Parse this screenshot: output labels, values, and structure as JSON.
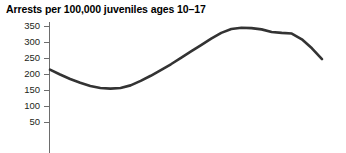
{
  "chart_data": {
    "type": "line",
    "title": "Arrests per 100,000 juveniles ages 10–17",
    "xlabel": "",
    "ylabel": "",
    "ylim": [
      0,
      350
    ],
    "yticks": [
      50,
      100,
      150,
      200,
      250,
      300,
      350
    ],
    "ytick_labels": [
      "50",
      "100",
      "150",
      "200",
      "250",
      "300",
      "350"
    ],
    "grid": false,
    "legend": "none",
    "line_color": "#333333",
    "axis_color": "#666666",
    "x_axis_cropped": true,
    "series": [
      {
        "name": "Arrests per 100,000 juveniles ages 10-17",
        "x": [
          0,
          1,
          2,
          3,
          4,
          5,
          6,
          7,
          8,
          9,
          10,
          11,
          12,
          13,
          14,
          15,
          16,
          17,
          18,
          19,
          20,
          21,
          22,
          23,
          24,
          25,
          26,
          27
        ],
        "values": [
          215,
          200,
          186,
          174,
          164,
          158,
          156,
          158,
          166,
          180,
          196,
          214,
          232,
          252,
          272,
          292,
          312,
          330,
          342,
          346,
          345,
          341,
          333,
          330,
          328,
          310,
          282,
          248
        ]
      }
    ],
    "annotations": []
  }
}
